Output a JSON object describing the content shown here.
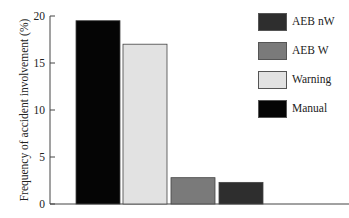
{
  "chart_data": {
    "type": "bar",
    "title": "",
    "xlabel": "",
    "ylabel": "Frequency of accident involvement (%)",
    "ylim": [
      0,
      20
    ],
    "yticks": [
      0,
      5,
      10,
      15,
      20
    ],
    "grid": false,
    "legend_position": "right",
    "categories": [
      "Manual",
      "Warning",
      "AEB W",
      "AEB nW"
    ],
    "values": [
      19.5,
      17.0,
      2.8,
      2.3
    ],
    "colors": [
      "#050505",
      "#e2e2e2",
      "#7a7a7a",
      "#2e2e2e"
    ],
    "legend": [
      {
        "label": "AEB nW",
        "color": "#2e2e2e"
      },
      {
        "label": "AEB W",
        "color": "#7a7a7a"
      },
      {
        "label": "Warning",
        "color": "#e2e2e2"
      },
      {
        "label": "Manual",
        "color": "#050505"
      }
    ]
  }
}
